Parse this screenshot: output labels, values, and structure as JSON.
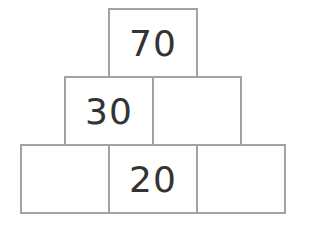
{
  "pyramid": {
    "rows": [
      {
        "level": "top",
        "cells": [
          {
            "value": "70"
          }
        ]
      },
      {
        "level": "middle",
        "cells": [
          {
            "value": "30"
          },
          {
            "value": ""
          }
        ]
      },
      {
        "level": "bottom",
        "cells": [
          {
            "value": ""
          },
          {
            "value": "20"
          },
          {
            "value": ""
          }
        ]
      }
    ]
  },
  "colors": {
    "border": "#a3a3a3",
    "text": "#333333",
    "background": "#ffffff"
  }
}
